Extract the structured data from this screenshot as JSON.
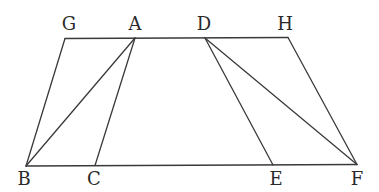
{
  "diagram": {
    "points": {
      "G": {
        "label": "G"
      },
      "A": {
        "label": "A"
      },
      "D": {
        "label": "D"
      },
      "H": {
        "label": "H"
      },
      "B": {
        "label": "B"
      },
      "C": {
        "label": "C"
      },
      "E": {
        "label": "E"
      },
      "F": {
        "label": "F"
      }
    },
    "segments": [
      [
        "G",
        "H"
      ],
      [
        "B",
        "F"
      ],
      [
        "G",
        "B"
      ],
      [
        "A",
        "B"
      ],
      [
        "A",
        "C"
      ],
      [
        "D",
        "E"
      ],
      [
        "D",
        "F"
      ],
      [
        "H",
        "F"
      ]
    ],
    "labels": [
      "G",
      "A",
      "D",
      "H",
      "B",
      "C",
      "E",
      "F"
    ]
  }
}
